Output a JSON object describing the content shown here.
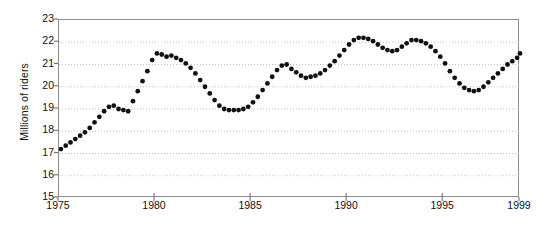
{
  "chart_data": {
    "type": "scatter",
    "title": "",
    "subtitle": "",
    "xlabel": "",
    "ylabel": "Millions of riders",
    "xlim": [
      1975,
      1999
    ],
    "ylim": [
      15,
      23
    ],
    "grid": true,
    "legend": null,
    "legend_position": "none",
    "marker": "filled-circle",
    "marker_color": "#111111",
    "axis_color": "#8c8c8c",
    "gridline_color": "#b9b9b9",
    "background_color": "#ffffff",
    "x_tick_labels": [
      "1975",
      "1980",
      "1985",
      "1990",
      "1995",
      "1999"
    ],
    "x_tick_values": [
      1975,
      1980,
      1985,
      1990,
      1995,
      1999
    ],
    "y_tick_labels": [
      "15",
      "16",
      "17",
      "18",
      "19",
      "20",
      "21",
      "22",
      "23"
    ],
    "y_tick_values": [
      15,
      16,
      17,
      18,
      19,
      20,
      21,
      22,
      23
    ],
    "series": [
      {
        "name": "riders",
        "x": [
          1975.1,
          1975.35,
          1975.6,
          1975.85,
          1976.1,
          1976.35,
          1976.6,
          1976.85,
          1977.1,
          1977.35,
          1977.6,
          1977.85,
          1978.1,
          1978.35,
          1978.6,
          1978.85,
          1979.1,
          1979.35,
          1979.6,
          1979.85,
          1980.1,
          1980.35,
          1980.6,
          1980.85,
          1981.1,
          1981.35,
          1981.6,
          1981.85,
          1982.1,
          1982.35,
          1982.6,
          1982.85,
          1983.1,
          1983.35,
          1983.6,
          1983.85,
          1984.1,
          1984.35,
          1984.6,
          1984.85,
          1985.1,
          1985.35,
          1985.6,
          1985.85,
          1986.1,
          1986.35,
          1986.6,
          1986.85,
          1987.1,
          1987.35,
          1987.6,
          1987.85,
          1988.1,
          1988.35,
          1988.6,
          1988.85,
          1989.1,
          1989.35,
          1989.6,
          1989.85,
          1990.1,
          1990.35,
          1990.6,
          1990.85,
          1991.1,
          1991.35,
          1991.6,
          1991.85,
          1992.1,
          1992.35,
          1992.6,
          1992.85,
          1993.1,
          1993.35,
          1993.6,
          1993.85,
          1994.1,
          1994.35,
          1994.6,
          1994.85,
          1995.1,
          1995.35,
          1995.6,
          1995.85,
          1996.1,
          1996.35,
          1996.6,
          1996.85,
          1997.1,
          1997.35,
          1997.6,
          1997.85,
          1998.1,
          1998.35,
          1998.6,
          1998.85,
          1999.0
        ],
        "y": [
          17.2,
          17.35,
          17.5,
          17.65,
          17.8,
          17.95,
          18.15,
          18.4,
          18.65,
          18.9,
          19.1,
          19.15,
          19.0,
          18.95,
          18.9,
          19.35,
          19.8,
          20.25,
          20.7,
          21.2,
          21.5,
          21.45,
          21.35,
          21.4,
          21.3,
          21.2,
          21.05,
          20.85,
          20.6,
          20.3,
          20.0,
          19.7,
          19.4,
          19.15,
          19.0,
          18.95,
          18.95,
          18.95,
          19.0,
          19.1,
          19.3,
          19.55,
          19.85,
          20.15,
          20.45,
          20.75,
          20.95,
          21.0,
          20.8,
          20.65,
          20.5,
          20.4,
          20.45,
          20.5,
          20.6,
          20.75,
          20.95,
          21.15,
          21.4,
          21.65,
          21.9,
          22.1,
          22.2,
          22.2,
          22.15,
          22.05,
          21.9,
          21.75,
          21.65,
          21.6,
          21.65,
          21.8,
          21.95,
          22.1,
          22.1,
          22.05,
          21.95,
          21.8,
          21.6,
          21.35,
          21.05,
          20.7,
          20.4,
          20.15,
          19.95,
          19.85,
          19.8,
          19.85,
          20.0,
          20.2,
          20.4,
          20.6,
          20.8,
          21.0,
          21.15,
          21.3,
          21.5
        ]
      }
    ]
  }
}
